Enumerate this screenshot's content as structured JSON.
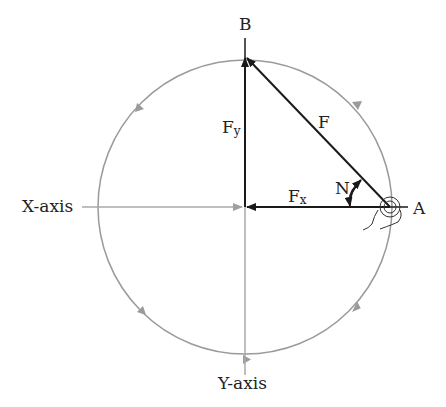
{
  "diagram": {
    "labels": {
      "point_a": "A",
      "point_b": "B",
      "x_axis": "X-axis",
      "y_axis": "Y-axis",
      "force": "F",
      "force_x_main": "F",
      "force_x_sub": "x",
      "force_y_main": "F",
      "force_y_sub": "y",
      "angle": "N"
    },
    "colors": {
      "circle": "#9a9a9a",
      "axis": "#a8a8a8",
      "vector": "#1a1a1a",
      "text": "#222222"
    },
    "geometry": {
      "center": [
        245,
        207
      ],
      "radius": 147,
      "point_a": [
        390,
        207
      ],
      "point_b": [
        245,
        58
      ]
    }
  }
}
